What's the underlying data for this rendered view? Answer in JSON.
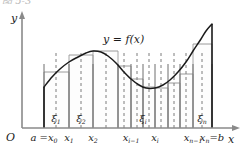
{
  "figure": {
    "caption_fragment": "图 5-3",
    "axis_y_label": "y",
    "axis_x_label": "x",
    "origin_label": "O",
    "curve_label": "y = f(x)",
    "colors": {
      "axis": "#8a8a8a",
      "curve": "#1b1b1b",
      "rect_top": "#9a9a9a",
      "partition": "#6f6f6f",
      "sample_dashed": "#7d7d7d",
      "endpoint": "#1b1b1b",
      "background": "#ffffff"
    }
  },
  "axis_ticks": [
    {
      "name": "x0",
      "label_main": "a =x",
      "label_sub": "0",
      "x": 44
    },
    {
      "name": "x1",
      "label_main": "x",
      "label_sub": "1",
      "x": 69
    },
    {
      "name": "x2",
      "label_main": "x",
      "label_sub": "2",
      "x": 93
    },
    {
      "name": "xi-1",
      "label_main": "x",
      "label_sub": "i−1",
      "x": 131
    },
    {
      "name": "xi",
      "label_main": "x",
      "label_sub": "i",
      "x": 155
    },
    {
      "name": "xn-1",
      "label_main": "x",
      "label_sub": "n−1",
      "x": 193
    },
    {
      "name": "xn",
      "label_main": "x",
      "label_sub": "n",
      "x": 212,
      "label_suffix": "=b"
    }
  ],
  "sample_labels": [
    {
      "name": "xi1",
      "label_main": "ξ",
      "label_sub": "1",
      "x": 56
    },
    {
      "name": "xi2",
      "label_main": "ξ",
      "label_sub": "2",
      "x": 81
    },
    {
      "name": "xii",
      "label_main": "ξ",
      "label_sub": "i",
      "x": 143
    },
    {
      "name": "xin",
      "label_main": "ξ",
      "label_sub": "n",
      "x": 202
    }
  ],
  "chart_data": {
    "type": "area",
    "xlabel": "x",
    "ylabel": "y",
    "grid": false,
    "legend": null,
    "axis_geometry": {
      "origin_px": [
        22,
        128
      ],
      "x_axis_end_px": [
        238,
        128
      ],
      "y_axis_top_px": [
        22,
        14
      ],
      "a_px": 44,
      "b_px": 212
    },
    "curve_points_px": [
      [
        44,
        87
      ],
      [
        52,
        77
      ],
      [
        60,
        69
      ],
      [
        69,
        62
      ],
      [
        78,
        57
      ],
      [
        86,
        53
      ],
      [
        93,
        51
      ],
      [
        101,
        52
      ],
      [
        108,
        56
      ],
      [
        116,
        63
      ],
      [
        123,
        71
      ],
      [
        131,
        79
      ],
      [
        139,
        85
      ],
      [
        146,
        88
      ],
      [
        155,
        88
      ],
      [
        163,
        85
      ],
      [
        170,
        80
      ],
      [
        178,
        72
      ],
      [
        186,
        62
      ],
      [
        193,
        51
      ],
      [
        201,
        39
      ],
      [
        206,
        31
      ],
      [
        212,
        24
      ]
    ],
    "partitions_px": [
      44,
      69,
      93,
      118,
      131,
      143,
      155,
      168,
      180,
      193,
      212
    ],
    "sample_points_px": [
      56,
      81,
      106,
      124,
      137,
      149,
      161,
      174,
      186,
      202
    ],
    "rectangles": [
      {
        "x_left": 44,
        "x_right": 69,
        "sample_x": 56,
        "top_px": 72
      },
      {
        "x_left": 69,
        "x_right": 93,
        "sample_x": 81,
        "top_px": 55
      },
      {
        "x_left": 93,
        "x_right": 118,
        "sample_x": 106,
        "top_px": 51
      },
      {
        "x_left": 118,
        "x_right": 131,
        "sample_x": 124,
        "top_px": 66
      },
      {
        "x_left": 131,
        "x_right": 143,
        "sample_x": 137,
        "top_px": 79
      },
      {
        "x_left": 143,
        "x_right": 155,
        "sample_x": 149,
        "top_px": 87
      },
      {
        "x_left": 155,
        "x_right": 168,
        "sample_x": 161,
        "top_px": 88
      },
      {
        "x_left": 168,
        "x_right": 180,
        "sample_x": 174,
        "top_px": 83
      },
      {
        "x_left": 180,
        "x_right": 193,
        "sample_x": 186,
        "top_px": 74
      },
      {
        "x_left": 193,
        "x_right": 212,
        "sample_x": 202,
        "top_px": 44
      }
    ],
    "baseline_px": 128
  }
}
